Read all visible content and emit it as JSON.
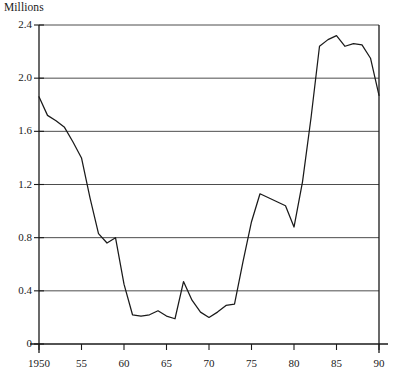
{
  "chart_data": {
    "type": "line",
    "title": "",
    "ylabel": "Millions",
    "xlabel": "",
    "ylim": [
      0,
      2.4
    ],
    "xlim": [
      1950,
      1990
    ],
    "grid": true,
    "legend": "none",
    "y_ticks": [
      "2.4",
      "2.0",
      "1.6",
      "1.2",
      "0.8",
      "0.4",
      "0"
    ],
    "y_tick_values": [
      2.4,
      2.0,
      1.6,
      1.2,
      0.8,
      0.4,
      0
    ],
    "x_ticks": [
      "1950",
      "55",
      "60",
      "65",
      "70",
      "75",
      "80",
      "85",
      "90"
    ],
    "x_tick_values": [
      1950,
      1955,
      1960,
      1965,
      1970,
      1975,
      1980,
      1985,
      1990
    ],
    "line_color": "#1a1a1a",
    "series": [
      {
        "name": "series-1",
        "x": [
          1950,
          1951,
          1952,
          1953,
          1954,
          1955,
          1956,
          1957,
          1958,
          1959,
          1960,
          1961,
          1962,
          1963,
          1964,
          1965,
          1966,
          1967,
          1968,
          1969,
          1970,
          1971,
          1972,
          1973,
          1974,
          1975,
          1976,
          1977,
          1978,
          1979,
          1980,
          1981,
          1982,
          1983,
          1984,
          1985,
          1986,
          1987,
          1988,
          1989,
          1990
        ],
        "values": [
          1.86,
          1.72,
          1.68,
          1.63,
          1.52,
          1.4,
          1.1,
          0.83,
          0.76,
          0.8,
          0.45,
          0.22,
          0.21,
          0.22,
          0.25,
          0.21,
          0.19,
          0.47,
          0.33,
          0.24,
          0.2,
          0.24,
          0.29,
          0.3,
          0.62,
          0.92,
          1.13,
          1.1,
          1.07,
          1.04,
          0.88,
          1.22,
          1.7,
          2.24,
          2.29,
          2.32,
          2.24,
          2.26,
          2.25,
          2.15,
          1.87
        ]
      }
    ]
  }
}
